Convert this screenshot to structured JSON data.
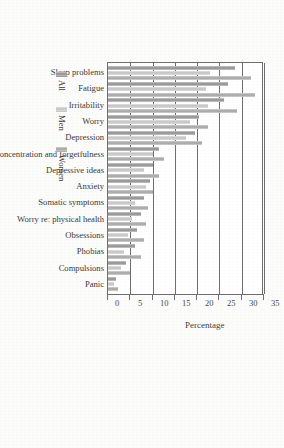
{
  "chart_data": {
    "type": "bar",
    "title": "",
    "subtitle": "",
    "xlabel": "",
    "ylabel": "Percentage",
    "ylim": [
      0,
      35
    ],
    "yticks": [
      0,
      5,
      10,
      15,
      20,
      25,
      30,
      35
    ],
    "grid": true,
    "grid_axis": "y",
    "legend_position": "bottom-left",
    "orientation": "vertical-bars-on-rotated-page",
    "categories": [
      "Sleep problems",
      "Fatigue",
      "Irritability",
      "Worry",
      "Depression",
      "Lack of concentration and forgetfulness",
      "Depressive ideas",
      "Anxiety",
      "Somatic symptoms",
      "Worry re: physical health",
      "Obsessions",
      "Phobias",
      "Compulsions",
      "Panic"
    ],
    "series": [
      {
        "name": "All",
        "color": "#9b9b9b",
        "values": [
          28.5,
          27.0,
          26.0,
          20.5,
          19.5,
          11.5,
          10.0,
          9.5,
          8.0,
          7.5,
          6.5,
          6.0,
          4.0,
          1.8
        ]
      },
      {
        "name": "Men",
        "color": "#c9c9c9",
        "values": [
          23.0,
          22.0,
          22.5,
          18.5,
          17.5,
          10.0,
          8.0,
          8.5,
          6.0,
          5.5,
          4.5,
          3.5,
          3.0,
          1.3
        ]
      },
      {
        "name": "Women",
        "color": "#adadad",
        "values": [
          32.0,
          33.0,
          29.0,
          22.5,
          21.0,
          12.5,
          11.5,
          10.0,
          9.0,
          8.5,
          8.0,
          7.5,
          5.0,
          2.3
        ]
      }
    ]
  },
  "axis": {
    "title": "Percentage",
    "tick_labels": [
      "0",
      "5",
      "10",
      "15",
      "20",
      "25",
      "30",
      "35"
    ]
  },
  "legend": {
    "items": [
      {
        "label": "All"
      },
      {
        "label": "Men"
      },
      {
        "label": "Women"
      }
    ]
  }
}
